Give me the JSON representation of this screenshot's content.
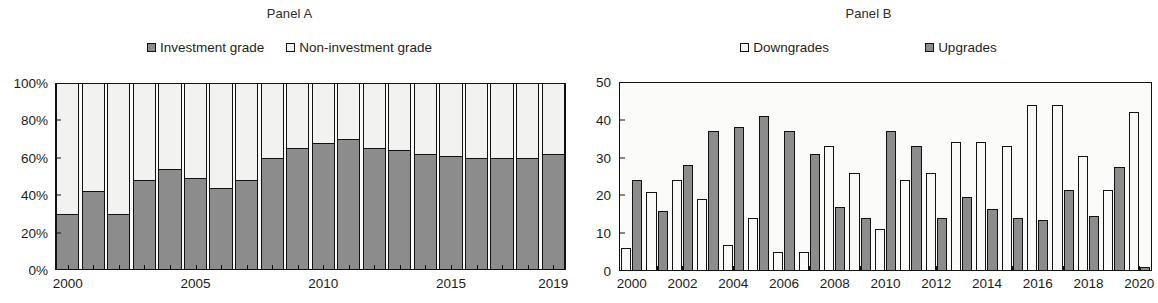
{
  "figure": {
    "panel_a_title": "Panel A",
    "panel_b_title": "Panel B"
  },
  "panel_a": {
    "title": "Panel A",
    "legend": [
      {
        "label": "Investment grade",
        "swatch": "dark",
        "color": "#8c8c8c"
      },
      {
        "label": "Non-investment grade",
        "swatch": "light",
        "color": "#f2f2f0"
      }
    ],
    "y_ticks": [
      "0%",
      "20%",
      "40%",
      "60%",
      "80%",
      "100%"
    ],
    "x_ticks": [
      "2000",
      "2005",
      "2010",
      "2015",
      "2019"
    ]
  },
  "panel_b": {
    "title": "Panel B",
    "legend": [
      {
        "label": "Downgrades",
        "swatch": "light",
        "color": "#fafaf8"
      },
      {
        "label": "Upgrades",
        "swatch": "dark",
        "color": "#8c8c8c"
      }
    ],
    "y_ticks": [
      "0",
      "10",
      "20",
      "30",
      "40",
      "50"
    ],
    "x_ticks": [
      "2000",
      "2002",
      "2004",
      "2006",
      "2008",
      "2010",
      "2012",
      "2014",
      "2016",
      "2018",
      "2020"
    ]
  },
  "chart_data": [
    {
      "type": "bar",
      "subtype": "stacked-100",
      "title": "Panel A",
      "xlabel": "",
      "ylabel": "",
      "ylim": [
        0,
        100
      ],
      "ytick_values": [
        0,
        20,
        40,
        60,
        80,
        100
      ],
      "ytick_labels": [
        "0%",
        "20%",
        "40%",
        "60%",
        "80%",
        "100%"
      ],
      "grid": false,
      "legend_position": "top-center",
      "categories": [
        "2000",
        "2001",
        "2002",
        "2003",
        "2004",
        "2005",
        "2006",
        "2007",
        "2008",
        "2009",
        "2010",
        "2011",
        "2012",
        "2013",
        "2014",
        "2015",
        "2016",
        "2017",
        "2018",
        "2019"
      ],
      "xtick_labels": [
        "2000",
        "2005",
        "2010",
        "2015",
        "2019"
      ],
      "series": [
        {
          "name": "Investment grade",
          "color": "#8c8c8c",
          "values": [
            30,
            42,
            30,
            48,
            54,
            49,
            44,
            48,
            60,
            65,
            68,
            70,
            65,
            64,
            62,
            61,
            60,
            60,
            60,
            62
          ]
        },
        {
          "name": "Non-investment grade",
          "color": "#f2f2f0",
          "values": [
            70,
            58,
            70,
            52,
            46,
            51,
            56,
            52,
            40,
            35,
            32,
            30,
            35,
            36,
            38,
            39,
            40,
            40,
            40,
            38
          ]
        }
      ]
    },
    {
      "type": "bar",
      "subtype": "grouped",
      "title": "Panel B",
      "xlabel": "",
      "ylabel": "",
      "ylim": [
        0,
        50
      ],
      "ytick_values": [
        0,
        10,
        20,
        30,
        40,
        50
      ],
      "ytick_labels": [
        "0",
        "10",
        "20",
        "30",
        "40",
        "50"
      ],
      "grid": false,
      "legend_position": "top-center",
      "categories": [
        "2000",
        "2001",
        "2002",
        "2003",
        "2004",
        "2005",
        "2006",
        "2007",
        "2008",
        "2009",
        "2010",
        "2011",
        "2012",
        "2013",
        "2014",
        "2015",
        "2016",
        "2017",
        "2018",
        "2019",
        "2020"
      ],
      "xtick_labels": [
        "2000",
        "2002",
        "2004",
        "2006",
        "2008",
        "2010",
        "2012",
        "2014",
        "2016",
        "2018",
        "2020"
      ],
      "series": [
        {
          "name": "Downgrades",
          "color": "#fafaf8",
          "values": [
            6,
            21,
            24,
            19,
            7,
            14,
            5,
            5,
            33,
            26,
            11,
            24,
            26,
            34,
            34,
            33,
            44,
            44,
            30.5,
            21.5,
            42
          ]
        },
        {
          "name": "Upgrades",
          "color": "#8c8c8c",
          "values": [
            24,
            16,
            28,
            37,
            38,
            41,
            37,
            31,
            17,
            14,
            37,
            33,
            14,
            19.5,
            16.5,
            14,
            13.5,
            21.5,
            14.5,
            27.5,
            1
          ]
        }
      ]
    }
  ]
}
